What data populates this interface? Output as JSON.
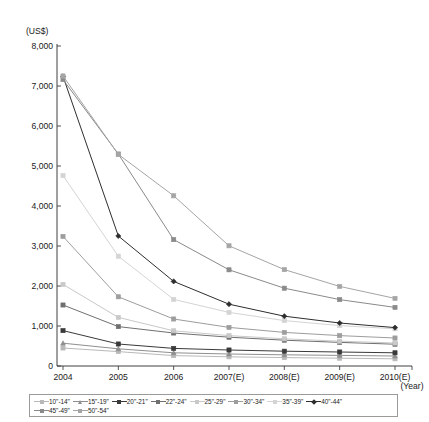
{
  "chart_data": {
    "type": "line",
    "title": "",
    "xlabel": "(Year)",
    "ylabel": "(US$)",
    "categories": [
      "2004",
      "2005",
      "2006",
      "2007(E)",
      "2008(E)",
      "2009(E)",
      "2010(E)"
    ],
    "ylim": [
      0,
      8000
    ],
    "ytick_labels": [
      "0",
      "1,000",
      "2,000",
      "3,000",
      "4,000",
      "5,000",
      "6,000",
      "7,000",
      "8,000"
    ],
    "ytick_values": [
      0,
      1000,
      2000,
      3000,
      4000,
      5000,
      6000,
      7000,
      8000
    ],
    "grid": false,
    "legend_position": "bottom",
    "series": [
      {
        "name": "10\"-14\"",
        "color": "#b9b9b9",
        "marker": "square",
        "values": [
          450,
          360,
          260,
          230,
          210,
          195,
          180
        ]
      },
      {
        "name": "15\"-19\"",
        "color": "#8f8f8f",
        "marker": "triangle",
        "values": [
          570,
          430,
          330,
          300,
          280,
          265,
          250
        ]
      },
      {
        "name": "20\"-21\"",
        "color": "#3a3a3a",
        "marker": "square",
        "values": [
          885,
          550,
          440,
          400,
          370,
          350,
          330
        ]
      },
      {
        "name": "22\"-24\"",
        "color": "#707070",
        "marker": "square",
        "values": [
          1525,
          985,
          825,
          720,
          645,
          590,
          545
        ]
      },
      {
        "name": "25\"-29\"",
        "color": "#c9c9c9",
        "marker": "square",
        "values": [
          2040,
          1215,
          880,
          760,
          680,
          620,
          575
        ]
      },
      {
        "name": "30\"-34\"",
        "color": "#9d9d9d",
        "marker": "square",
        "values": [
          3240,
          1730,
          1175,
          965,
          840,
          760,
          700
        ]
      },
      {
        "name": "35\"-39\"",
        "color": "#d4d4d4",
        "marker": "square",
        "values": [
          4760,
          2745,
          1665,
          1340,
          1135,
          1010,
          930
        ]
      },
      {
        "name": "40\"-44\"",
        "color": "#2e2e2e",
        "marker": "diamond",
        "values": [
          7240,
          3250,
          2115,
          1545,
          1245,
          1075,
          960
        ]
      },
      {
        "name": "45\"-49\"",
        "color": "#8a8a8a",
        "marker": "square",
        "values": [
          7160,
          5300,
          3160,
          2405,
          1945,
          1660,
          1465
        ]
      },
      {
        "name": "50\"-54\"",
        "color": "#a5a5a5",
        "marker": "square",
        "values": [
          7250,
          5290,
          4255,
          3005,
          2410,
          1990,
          1690
        ]
      }
    ]
  },
  "legend": {
    "row1": [
      "10\"-14\"",
      "15\"-19\"",
      "20\"-21\"",
      "22\"-24\"",
      "25\"-29\"",
      "30\"-34\"",
      "35\"-39\"",
      "40\"-44\""
    ],
    "row2": [
      "45\"-49\"",
      "50\"-54\""
    ]
  }
}
